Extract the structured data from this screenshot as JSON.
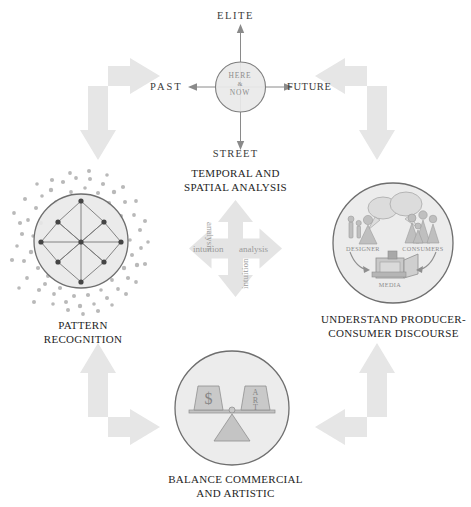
{
  "diagram": {
    "title_present": false,
    "background_color": "#ffffff",
    "arrow_color": "#e6e6e6",
    "circle_fill": "#e9e9e9",
    "circle_stroke": "#8f8f8f",
    "accent_text": "#1e1e1e"
  },
  "center": {
    "diamond": {
      "arrow_color": "#e4e4e4",
      "word_left": "intuition",
      "word_right": "analysis",
      "word_top": "analysis",
      "word_bottom": "intuition"
    }
  },
  "quadrants": {
    "top": {
      "caption_line1": "TEMPORAL AND",
      "caption_line2": "SPATIAL ANALYSIS",
      "axis": {
        "north": "ELITE",
        "south": "STREET",
        "west": "PAST",
        "east": "FUTURE"
      },
      "core": {
        "line1": "HERE",
        "line2": "&",
        "line3": "NOW"
      }
    },
    "left": {
      "caption_line1": "PATTERN",
      "caption_line2": "RECOGNITION"
    },
    "right": {
      "caption_line1": "UNDERSTAND PRODUCER-",
      "caption_line2": "CONSUMER DISCOURSE",
      "labels": {
        "designer": "DESIGNER",
        "consumers": "CONSUMERS",
        "media": "MEDIA"
      }
    },
    "bottom": {
      "caption_line1": "BALANCE COMMERCIAL",
      "caption_line2": "AND ARTISTIC",
      "scale": {
        "left_weight": "$",
        "right_weight_line1": "A",
        "right_weight_line2": "R",
        "right_weight_line3": "T"
      }
    }
  },
  "flow_arrows": {
    "top_left": "bend-right-down",
    "top_right": "bend-left-down",
    "bottom_left": "bend-up-right",
    "bottom_right": "bend-up-left"
  }
}
